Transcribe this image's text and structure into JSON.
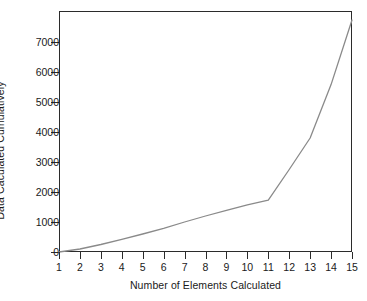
{
  "chart_data": {
    "type": "line",
    "title": "",
    "xlabel": "Number of Elements Calculated",
    "ylabel": "Data Caculated Cumulatively",
    "x": [
      1,
      2,
      3,
      4,
      5,
      6,
      7,
      8,
      9,
      10,
      11,
      12,
      13,
      14,
      15
    ],
    "values": [
      0,
      100,
      250,
      420,
      600,
      790,
      1000,
      1200,
      1390,
      1570,
      1733,
      2750,
      3800,
      5580,
      7733
    ],
    "series": [
      {
        "name": "Data Caculated Cumulatively",
        "values": [
          0,
          100,
          250,
          420,
          600,
          790,
          1000,
          1200,
          1390,
          1570,
          1733,
          2750,
          3800,
          5580,
          7733
        ]
      }
    ],
    "xlim": [
      1,
      15
    ],
    "ylim": [
      0,
      7733
    ],
    "xticks": [
      1,
      2,
      3,
      4,
      5,
      6,
      7,
      8,
      9,
      10,
      11,
      12,
      13,
      14,
      15
    ],
    "yticks": [
      0,
      1000,
      2000,
      3000,
      4000,
      5000,
      6000,
      7000
    ],
    "xtick_labels": [
      "1",
      "2",
      "3",
      "4",
      "5",
      "6",
      "7",
      "8",
      "9",
      "10",
      "11",
      "12",
      "13",
      "14",
      "15"
    ],
    "ytick_labels": [
      "0",
      "1000",
      "2000",
      "3000",
      "4000",
      "5000",
      "6000",
      "7000"
    ],
    "grid": false,
    "legend": false,
    "legend_position": "none",
    "line_color": "#8a8a8a",
    "frame_color": "#2b2b2b",
    "background_color": "#ffffff"
  }
}
